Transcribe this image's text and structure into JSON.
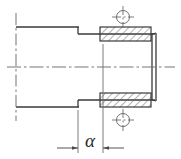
{
  "drawing": {
    "title": "Stepped shaft section with bearing bushes",
    "type": "engineering-section-view",
    "canvas": {
      "width": 181,
      "height": 159,
      "background": "#ffffff"
    },
    "colors": {
      "outline": "#3a3a3a",
      "center_line": "#6e6e6e",
      "hatch": "#5a5a5a",
      "dimension": "#4a4a4a",
      "label": "#2b2b2b"
    },
    "labels": {
      "angle_dimension": "α"
    },
    "geometry": {
      "shaft_large": {
        "x": 16,
        "y": 27,
        "width": 62,
        "height": 80,
        "label": "large-diameter-shaft"
      },
      "shaft_small": {
        "x": 78,
        "y": 34,
        "width": 75,
        "height": 66,
        "label": "small-diameter-shaft"
      },
      "end_cap": {
        "x": 153,
        "y": 34,
        "width": 4,
        "height": 66,
        "label": "shaft-end-face"
      },
      "bush_upper": {
        "x": 100,
        "y": 27,
        "width": 51,
        "height": 14,
        "label": "upper-bush"
      },
      "bush_lower": {
        "x": 100,
        "y": 93,
        "width": 51,
        "height": 14,
        "label": "lower-bush"
      },
      "center_mark_upper": {
        "cx": 123,
        "cy": 17,
        "r": 6.5
      },
      "center_mark_lower": {
        "cx": 123,
        "cy": 120,
        "r": 6.5
      },
      "axis_center_line": {
        "x1": 8,
        "y1": 67,
        "x2": 174,
        "y2": 67
      },
      "left_break_line": {
        "x1": 16,
        "y1": 14,
        "x2": 16,
        "y2": 120
      },
      "dimension_line": {
        "x1": 57,
        "y1": 148,
        "x2": 124,
        "y2": 148,
        "from": 78,
        "to": 103
      },
      "extension_left": {
        "x": 78,
        "y1": 110,
        "y2": 152
      },
      "extension_right": {
        "x": 103,
        "y1": 44,
        "y2": 152
      }
    }
  }
}
